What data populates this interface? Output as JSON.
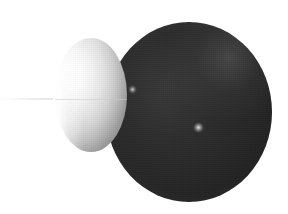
{
  "scene": {
    "title": "Two overlapping shaded spheres",
    "description": "Ray-traced render of a large dark sphere partially occluded on its left by a smaller light-grey sphere, on a plain white background",
    "width_px": 288,
    "height_px": 214,
    "background_color": "#ffffff",
    "render_style": "dithered / noisy raytrace",
    "light_direction": "upper-left"
  },
  "objects": {
    "dark_sphere": {
      "name": "large dark sphere",
      "base_color": "#262626",
      "shadow_color": "#121212",
      "terminator_color": "#3a3a3a",
      "center_x": 189,
      "center_y": 112,
      "radius_x": 83,
      "radius_y": 90
    },
    "light_sphere": {
      "name": "small light sphere",
      "base_color": "#f2f2f2",
      "highlight_color": "#ffffff",
      "shadow_color": "#9a9a9a",
      "center_x": 91,
      "center_y": 95,
      "radius_x": 36,
      "radius_y": 57
    }
  },
  "highlights": [
    {
      "name": "specular-highlight-upper",
      "x": 132,
      "y": 89,
      "size": 9,
      "color": "#cdcdcd"
    },
    {
      "name": "specular-highlight-lower",
      "x": 198,
      "y": 127,
      "size": 11,
      "color": "#e2e2e2"
    }
  ],
  "artifacts": {
    "ground_line": {
      "name": "faint horizontal ground line",
      "y": 99,
      "x_start": 0,
      "x_end": 170,
      "color": "#e4e4e4"
    }
  }
}
